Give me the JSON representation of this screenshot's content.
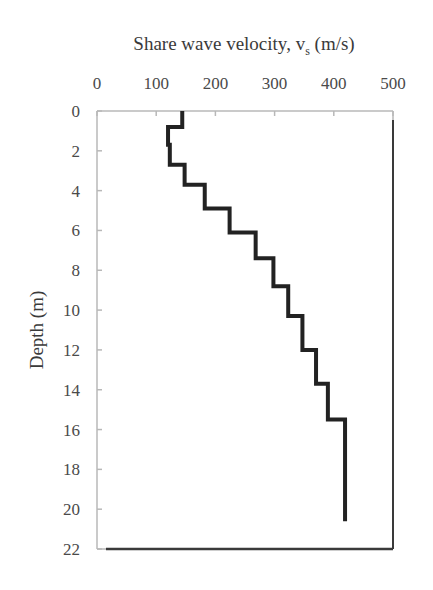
{
  "chart_data": {
    "type": "line",
    "subtype": "step-profile",
    "title": "",
    "xlabel": "Share wave velocity, v_s (m/s)",
    "xlabel_main": "Share wave velocity, v",
    "xlabel_sub": "s",
    "xlabel_unit": " (m/s)",
    "ylabel": "Depth (m)",
    "xlim": [
      0,
      500
    ],
    "ylim": [
      22,
      0
    ],
    "x_axis_position": "top",
    "y_inverted": true,
    "x_ticks": [
      "0",
      "100",
      "200",
      "300",
      "400",
      "500"
    ],
    "y_ticks": [
      "0",
      "2",
      "4",
      "6",
      "8",
      "10",
      "12",
      "14",
      "16",
      "18",
      "20",
      "22"
    ],
    "grid": false,
    "legend": null,
    "series": [
      {
        "name": "Vs profile",
        "color": "#222222",
        "layers": [
          {
            "top": 0.0,
            "bottom": 0.8,
            "vs": 144
          },
          {
            "top": 0.8,
            "bottom": 1.7,
            "vs": 120
          },
          {
            "top": 1.7,
            "bottom": 2.7,
            "vs": 123
          },
          {
            "top": 2.7,
            "bottom": 3.7,
            "vs": 148
          },
          {
            "top": 3.7,
            "bottom": 4.9,
            "vs": 182
          },
          {
            "top": 4.9,
            "bottom": 6.1,
            "vs": 224
          },
          {
            "top": 6.1,
            "bottom": 7.4,
            "vs": 268
          },
          {
            "top": 7.4,
            "bottom": 8.8,
            "vs": 298
          },
          {
            "top": 8.8,
            "bottom": 10.3,
            "vs": 323
          },
          {
            "top": 10.3,
            "bottom": 12.0,
            "vs": 347
          },
          {
            "top": 12.0,
            "bottom": 13.7,
            "vs": 370
          },
          {
            "top": 13.7,
            "bottom": 15.5,
            "vs": 390
          },
          {
            "top": 15.5,
            "bottom": 20.6,
            "vs": 419
          }
        ]
      }
    ]
  },
  "colors": {
    "line": "#222222",
    "frame_light": "#b8b8b8",
    "frame_dark": "#3a3a3a",
    "text": "#3a3a3a"
  }
}
